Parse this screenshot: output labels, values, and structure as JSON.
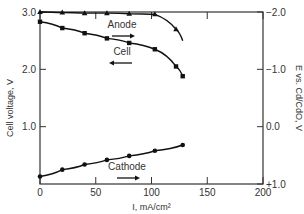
{
  "chart_data": {
    "type": "line",
    "title": "",
    "xlabel": "I, mA/cm²",
    "ylabel": "Cell voltage, V",
    "ylabel_right": "E vs. Cd/CdO, V",
    "xlim": [
      0,
      200
    ],
    "ylim": [
      0,
      3.0
    ],
    "ylim_right": [
      1.0,
      -2.0
    ],
    "x_ticks": [
      "0",
      "50",
      "100",
      "150",
      "200"
    ],
    "y_ticks": [
      "1.0",
      "2.0",
      "3.0"
    ],
    "y_ticks_right": [
      "+1.0",
      "0.0",
      "−1.0",
      "−2.0"
    ],
    "grid": false,
    "series": [
      {
        "name": "Anode",
        "axis": "right",
        "marker": "triangle",
        "direction": "right",
        "x": [
          0,
          20,
          40,
          60,
          80,
          103,
          122,
          128
        ],
        "y": [
          -2.0,
          -1.99,
          -1.98,
          -1.98,
          -1.97,
          -1.96,
          -1.7,
          -1.5
        ]
      },
      {
        "name": "Cell",
        "axis": "left",
        "marker": "square",
        "direction": "left",
        "x": [
          0,
          20,
          40,
          60,
          80,
          103,
          122,
          128
        ],
        "y": [
          2.83,
          2.72,
          2.63,
          2.54,
          2.46,
          2.35,
          2.05,
          1.88
        ]
      },
      {
        "name": "Cathode",
        "axis": "right",
        "marker": "circle",
        "direction": "right",
        "x": [
          0,
          20,
          40,
          60,
          80,
          103,
          128
        ],
        "y": [
          0.87,
          0.75,
          0.66,
          0.58,
          0.51,
          0.42,
          0.32
        ]
      }
    ],
    "annotations": [
      {
        "text": "Anode",
        "arrow": "right"
      },
      {
        "text": "Cell",
        "arrow": "left"
      },
      {
        "text": "Cathode",
        "arrow": "right"
      }
    ]
  }
}
